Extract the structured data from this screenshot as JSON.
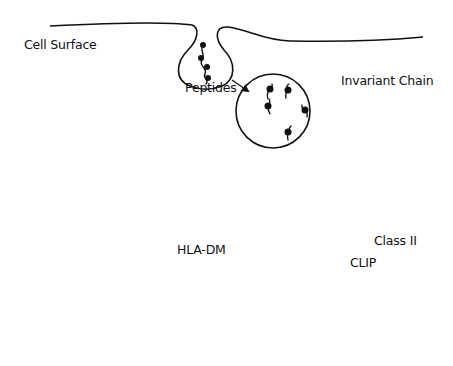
{
  "diagram": {
    "labels": {
      "cell_surface": "Cell Surface",
      "peptides": "Peptides",
      "invariant_chain": "Invariant Chain",
      "class_ii": "Class II",
      "clip": "CLIP",
      "hla_dm": "HLA-DM"
    },
    "colors": {
      "line": "#111111",
      "class_ii_molecule": "#8a8a8a",
      "clip": "#9a9a9a",
      "background": "#ffffff"
    },
    "nodes": [
      {
        "id": "endocytosis-vesicle",
        "description": "membrane invagination with protein"
      },
      {
        "id": "endosome",
        "description": "circle with peptides"
      },
      {
        "id": "er-vesicle",
        "description": "ellipse with Class II and invariant chain"
      },
      {
        "id": "fusion-compartment",
        "description": "peanut-shaped compartment with CLIP-bound class II"
      },
      {
        "id": "hla-dm-compartment",
        "description": "circle with HLA-DM exchanging CLIP"
      },
      {
        "id": "loaded-vesicle",
        "description": "ellipse with peptide-loaded class II"
      }
    ],
    "edges": [
      {
        "from": "endocytosis-vesicle",
        "to": "endosome"
      },
      {
        "from": "endosome",
        "to": "fusion-compartment"
      },
      {
        "from": "er-vesicle",
        "to": "fusion-compartment"
      },
      {
        "from": "fusion-compartment",
        "to": "hla-dm-compartment"
      },
      {
        "from": "hla-dm-compartment",
        "to": "loaded-vesicle"
      },
      {
        "from": "loaded-vesicle",
        "to": "cell-surface"
      }
    ]
  }
}
